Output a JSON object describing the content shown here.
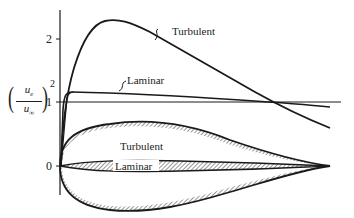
{
  "diagram": {
    "y_axis": {
      "label_numerator": "u",
      "label_numerator_sub": "e",
      "label_denominator": "u",
      "label_denominator_sub": "∞",
      "label_exponent": "2",
      "ticks": [
        "0",
        "1",
        "2"
      ]
    },
    "curves": {
      "turbulent_label": "Turbulent",
      "laminar_label": "Laminar"
    },
    "body_shapes": {
      "turbulent_label": "Turbulent",
      "laminar_label": "Laminar"
    },
    "colors": {
      "line": "#1a1a1a",
      "background": "#ffffff"
    }
  }
}
